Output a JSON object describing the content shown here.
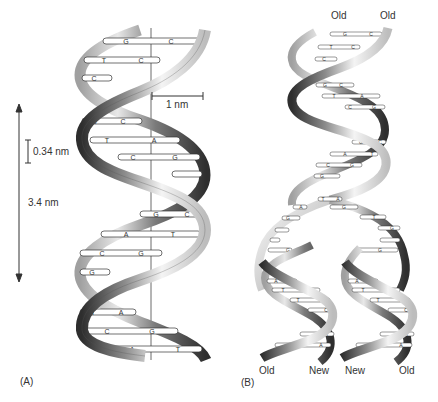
{
  "figure": {
    "panel_a": {
      "label": "(A)",
      "scale_axis_length_label": "3.4 nm",
      "base_pair_rise_label": "0.34 nm",
      "radius_label": "1 nm",
      "base_pairs": [
        {
          "left": "G",
          "right": "C"
        },
        {
          "left": "T",
          "right": "C"
        },
        {
          "left": "C",
          "right": ""
        },
        {
          "left": "G",
          "right": "C"
        },
        {
          "left": "T",
          "right": "A"
        },
        {
          "left": "C",
          "right": "G"
        },
        {
          "left": "G",
          "right": "C"
        },
        {
          "left": "A",
          "right": "T"
        },
        {
          "left": "C",
          "right": "G"
        },
        {
          "left": "G",
          "right": ""
        },
        {
          "left": "T",
          "right": "A"
        },
        {
          "left": "C",
          "right": "G"
        },
        {
          "left": "A",
          "right": "T"
        }
      ]
    },
    "panel_b": {
      "label": "(B)",
      "top_strand_labels": [
        "Old",
        "Old"
      ],
      "bottom_strand_labels": [
        "Old",
        "New",
        "New",
        "Old"
      ],
      "parent_base_pairs": [
        {
          "left": "G",
          "right": "C"
        },
        {
          "left": "T",
          "right": "C"
        },
        {
          "left": "C",
          "right": ""
        },
        {
          "left": "G",
          "right": "C"
        },
        {
          "left": "T",
          "right": "A"
        },
        {
          "left": "C",
          "right": "G"
        },
        {
          "left": "G",
          "right": "C"
        },
        {
          "left": "A",
          "right": "T"
        },
        {
          "left": "C",
          "right": "G"
        },
        {
          "left": "G",
          "right": ""
        }
      ],
      "fork_left_bases": [
        "T",
        "A",
        "G",
        "G"
      ],
      "fork_right_bases": [
        "A",
        "G",
        "T",
        "G",
        "G"
      ],
      "daughter_left_base_pairs": [
        {
          "left": "A",
          "right": "T"
        },
        {
          "left": "T",
          "right": "A"
        },
        {
          "left": "T",
          "right": "A"
        },
        {
          "left": "",
          "right": "C"
        },
        {
          "left": "",
          "right": "A"
        },
        {
          "left": "T",
          "right": "A"
        }
      ],
      "daughter_right_base_pairs": [
        {
          "left": "A",
          "right": "T"
        },
        {
          "left": "T",
          "right": "A"
        },
        {
          "left": "T",
          "right": "A"
        },
        {
          "left": "",
          "right": "C"
        },
        {
          "left": "",
          "right": "A"
        },
        {
          "left": "T",
          "right": "A"
        }
      ]
    },
    "colors": {
      "ribbon_light": "#f2f2f2",
      "ribbon_mid": "#9a9a9a",
      "ribbon_dark": "#3a3a3a",
      "line": "#333333",
      "background": "#ffffff"
    }
  }
}
